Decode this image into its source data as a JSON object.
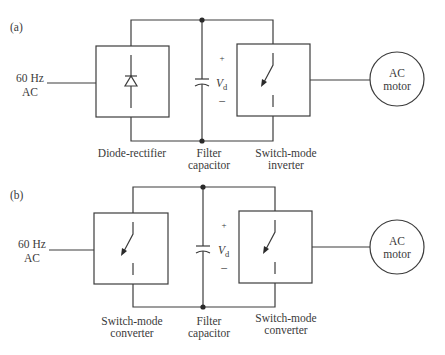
{
  "diagrams": [
    {
      "panel_label": "(a)",
      "source": {
        "line1": "60 Hz",
        "line2": "AC"
      },
      "left_block": {
        "type": "diode-rectifier",
        "label": "Diode-rectifier",
        "label_line2": ""
      },
      "capacitor": {
        "label_line1": "Filter",
        "label_line2": "capacitor",
        "plus": "+",
        "minus": "–",
        "voltage": "V",
        "voltage_sub": "d"
      },
      "right_block": {
        "type": "switch",
        "label_line1": "Switch-mode",
        "label_line2": "inverter"
      },
      "load": {
        "line1": "AC",
        "line2": "motor"
      }
    },
    {
      "panel_label": "(b)",
      "source": {
        "line1": "60 Hz",
        "line2": "AC"
      },
      "left_block": {
        "type": "switch",
        "label_line1": "Switch-mode",
        "label_line2": "converter"
      },
      "capacitor": {
        "label_line1": "Filter",
        "label_line2": "capacitor",
        "plus": "+",
        "minus": "–",
        "voltage": "V",
        "voltage_sub": "d"
      },
      "right_block": {
        "type": "switch",
        "label_line1": "Switch-mode",
        "label_line2": "converter"
      },
      "load": {
        "line1": "AC",
        "line2": "motor"
      }
    }
  ]
}
